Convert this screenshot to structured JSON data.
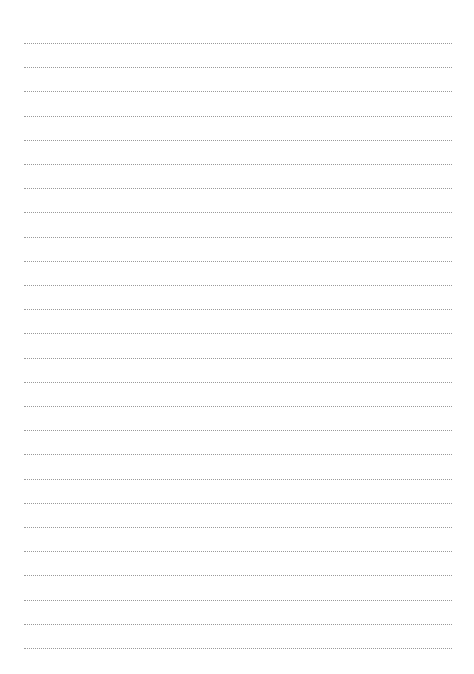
{
  "page": {
    "type": "blank lined writing sheet",
    "background_color": "#ffffff",
    "line_color": "#9a9a9a",
    "line_style": "dotted",
    "line_count": 26,
    "first_line_y": 43,
    "line_spacing": 24.2,
    "line_left": 24,
    "line_width": 428
  }
}
